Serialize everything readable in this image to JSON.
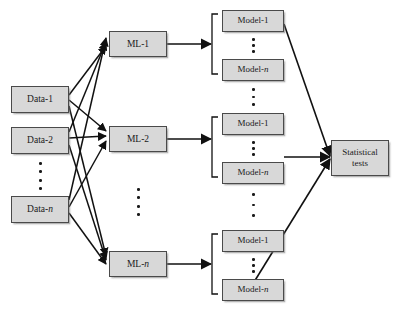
{
  "diagram": {
    "type": "flow-diagram",
    "canvas": {
      "width": 401,
      "height": 316,
      "background": "#ffffff"
    },
    "style": {
      "node_fill": "#d8d8d8",
      "node_border": "#4a4a4a",
      "edge_color": "#111111",
      "text_color": "#1a1a1a"
    },
    "columns": {
      "data_label": "Data",
      "ml_label": "ML",
      "model_label": "Model",
      "stats_label": "Statistical tests"
    },
    "data_nodes": [
      {
        "id": "data-1",
        "label": "Data-1",
        "x": 11,
        "y": 86,
        "w": 58,
        "h": 27
      },
      {
        "id": "data-2",
        "label": "Data-2",
        "x": 11,
        "y": 127,
        "w": 58,
        "h": 27
      },
      {
        "id": "data-n",
        "label": "Data-n",
        "x": 11,
        "y": 196,
        "w": 58,
        "h": 27
      }
    ],
    "ml_nodes": [
      {
        "id": "ml-1",
        "label": "ML-1",
        "x": 109,
        "y": 31,
        "w": 58,
        "h": 26
      },
      {
        "id": "ml-2",
        "label": "ML-2",
        "x": 109,
        "y": 126,
        "w": 58,
        "h": 26
      },
      {
        "id": "ml-n",
        "label": "ML-n",
        "x": 109,
        "y": 251,
        "w": 58,
        "h": 26
      }
    ],
    "model_groups": [
      {
        "id": "model-group-1",
        "parent": "ml-1",
        "nodes": [
          {
            "id": "m1-first",
            "label": "Model-1",
            "x": 222,
            "y": 10,
            "w": 62,
            "h": 22
          },
          {
            "id": "m1-last",
            "label": "Model-n",
            "x": 222,
            "y": 59,
            "w": 62,
            "h": 22
          }
        ]
      },
      {
        "id": "model-group-2",
        "parent": "ml-2",
        "nodes": [
          {
            "id": "m2-first",
            "label": "Model-1",
            "x": 222,
            "y": 113,
            "w": 62,
            "h": 22
          },
          {
            "id": "m2-last",
            "label": "Model-n",
            "x": 222,
            "y": 162,
            "w": 62,
            "h": 22
          }
        ]
      },
      {
        "id": "model-group-n",
        "parent": "ml-n",
        "nodes": [
          {
            "id": "mn-first",
            "label": "Model-1",
            "x": 222,
            "y": 230,
            "w": 62,
            "h": 22
          },
          {
            "id": "mn-last",
            "label": "Model-n",
            "x": 222,
            "y": 279,
            "w": 62,
            "h": 22
          }
        ]
      }
    ],
    "stats_node": {
      "id": "statistical-tests",
      "line1": "Statistical",
      "line2": "tests",
      "x": 331,
      "y": 140,
      "w": 58,
      "h": 36
    },
    "ellipses": [
      {
        "id": "data-ellipsis",
        "x": 40,
        "y": 165,
        "count": 4,
        "orientation": "vertical"
      },
      {
        "id": "ml-ellipsis",
        "x": 138,
        "y": 190,
        "count": 4,
        "orientation": "vertical"
      },
      {
        "id": "model-group-1-dots",
        "x": 253,
        "y": 38,
        "count": 3,
        "orientation": "vertical"
      },
      {
        "id": "model-group-2-dots",
        "x": 253,
        "y": 141,
        "count": 3,
        "orientation": "vertical"
      },
      {
        "id": "model-group-n-dots",
        "x": 253,
        "y": 258,
        "count": 3,
        "orientation": "vertical"
      },
      {
        "id": "between-group-1-2",
        "x": 253,
        "y": 88,
        "count": 3,
        "orientation": "vertical"
      },
      {
        "id": "between-group-2-n",
        "x": 253,
        "y": 193,
        "count": 3,
        "orientation": "vertical"
      }
    ]
  }
}
